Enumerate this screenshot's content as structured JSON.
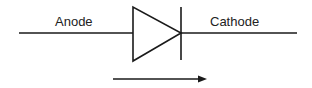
{
  "diagram": {
    "type": "diode-symbol",
    "labels": {
      "anode": "Anode",
      "cathode": "Cathode"
    },
    "arrow": {
      "direction": "right",
      "meaning": "current-flow"
    },
    "colors": {
      "stroke": "#1a1a1a",
      "background": "#ffffff",
      "text": "#222222"
    }
  }
}
